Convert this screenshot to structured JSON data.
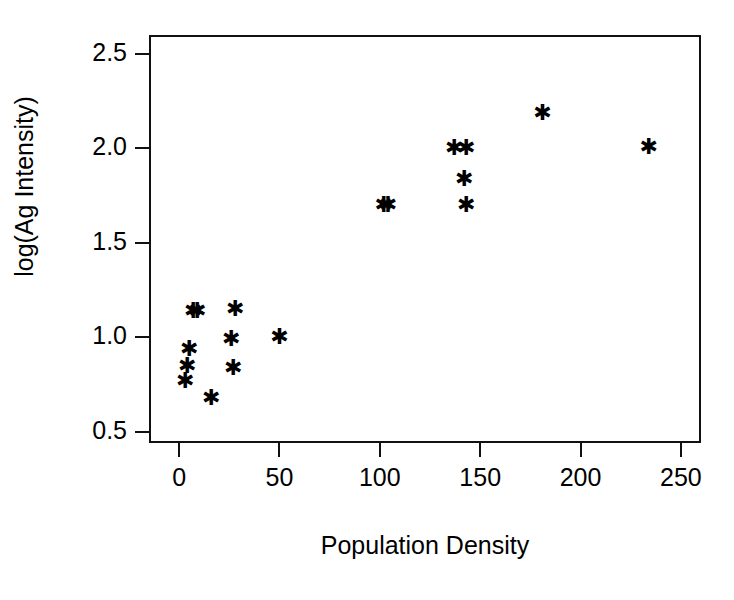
{
  "chart_data": {
    "type": "scatter",
    "title": "",
    "xlabel": "Population Density",
    "ylabel": "log(Ag Intensity)",
    "xlim": [
      -15,
      260
    ],
    "ylim": [
      0.44,
      2.6
    ],
    "xticks": [
      0,
      50,
      100,
      150,
      200,
      250
    ],
    "xtick_labels": [
      "0",
      "50",
      "100",
      "150",
      "200",
      "250"
    ],
    "yticks": [
      0.5,
      1.0,
      1.5,
      2.0,
      2.5
    ],
    "ytick_labels": [
      "0.5",
      "1.0",
      "1.5",
      "2.0",
      "2.5"
    ],
    "grid": false,
    "legend": null,
    "marker": "star",
    "marker_color": "#000000",
    "series": [
      {
        "name": "observations",
        "points": [
          {
            "x": 4,
            "y": 0.95
          },
          {
            "x": 3,
            "y": 0.86
          },
          {
            "x": 2,
            "y": 0.78
          },
          {
            "x": 6,
            "y": 1.15
          },
          {
            "x": 8,
            "y": 1.15
          },
          {
            "x": 15,
            "y": 0.69
          },
          {
            "x": 25,
            "y": 1.0
          },
          {
            "x": 26,
            "y": 0.85
          },
          {
            "x": 27,
            "y": 1.16
          },
          {
            "x": 49,
            "y": 1.01
          },
          {
            "x": 101,
            "y": 1.71
          },
          {
            "x": 103,
            "y": 1.71
          },
          {
            "x": 136,
            "y": 2.01
          },
          {
            "x": 142,
            "y": 2.01
          },
          {
            "x": 141,
            "y": 1.85
          },
          {
            "x": 142,
            "y": 1.71
          },
          {
            "x": 180,
            "y": 2.2
          },
          {
            "x": 233,
            "y": 2.02
          }
        ]
      }
    ]
  },
  "figure": {
    "marker_glyph": "✱",
    "axis_color": "#111111",
    "background": "#ffffff"
  }
}
